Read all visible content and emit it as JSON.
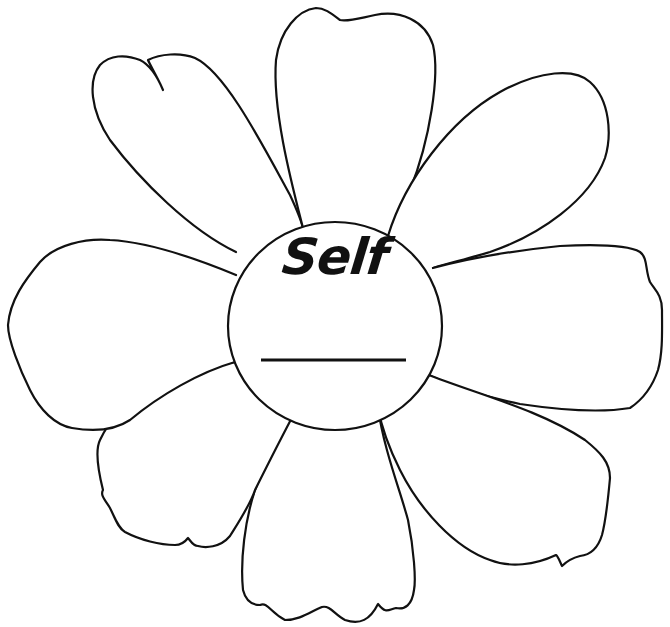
{
  "worksheet": {
    "title": "Self",
    "blank_line_value": "",
    "petal_count": 8,
    "petals": [
      {
        "id": "top",
        "value": ""
      },
      {
        "id": "upper-right",
        "value": ""
      },
      {
        "id": "right",
        "value": ""
      },
      {
        "id": "lower-right",
        "value": ""
      },
      {
        "id": "bottom",
        "value": ""
      },
      {
        "id": "lower-left",
        "value": ""
      },
      {
        "id": "left",
        "value": ""
      },
      {
        "id": "upper-left",
        "value": ""
      }
    ],
    "colors": {
      "outline": "#111111",
      "background": "#ffffff"
    }
  }
}
